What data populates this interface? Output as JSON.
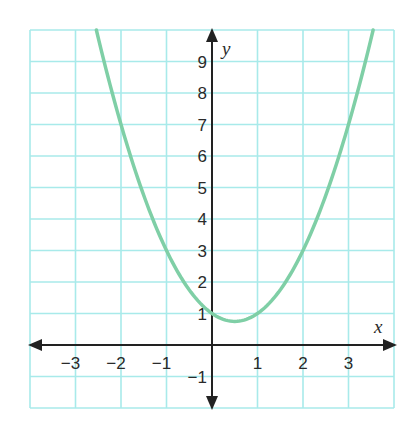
{
  "chart_data": {
    "type": "line",
    "title": "",
    "xlabel": "x",
    "ylabel": "y",
    "xlim": [
      -4,
      4
    ],
    "ylim": [
      -2,
      10
    ],
    "grid": true,
    "x_ticks": [
      -3,
      -2,
      -1,
      1,
      2,
      3
    ],
    "y_ticks": [
      -1,
      1,
      2,
      3,
      4,
      5,
      6,
      7,
      8,
      9
    ],
    "x_tick_labels": [
      "−3",
      "−2",
      "−1",
      "1",
      "2",
      "3"
    ],
    "y_tick_labels": [
      "−1",
      "1",
      "2",
      "3",
      "4",
      "5",
      "6",
      "7",
      "8",
      "9"
    ],
    "series": [
      {
        "name": "parabola",
        "equation": "y = x^2 - x + 1",
        "vertex": [
          0.5,
          0.75
        ],
        "y_intercept": 1,
        "x": [
          -2.54,
          -2,
          -1.5,
          -1,
          -0.5,
          0,
          0.5,
          1,
          1.5,
          2,
          2.5,
          3,
          3.54
        ],
        "values": [
          10,
          7,
          4.75,
          3,
          1.75,
          1,
          0.75,
          1,
          1.75,
          3,
          4.75,
          7,
          10
        ]
      }
    ],
    "colors": {
      "curve": "#7fcfa6",
      "grid": "#a8eaea",
      "axes": "#222222"
    }
  }
}
